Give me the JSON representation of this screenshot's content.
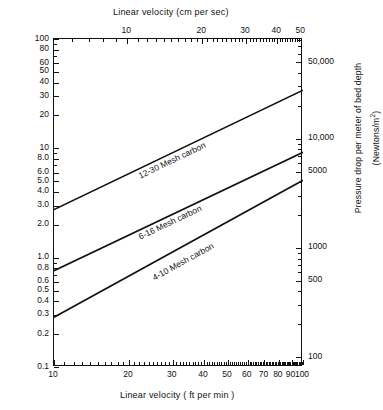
{
  "chart_data": {
    "type": "line",
    "title": "",
    "scale": {
      "x": "log",
      "y": "log"
    },
    "grid": false,
    "legend_position": "inline-curve-labels",
    "axes": {
      "bottom": {
        "label": "Linear  velocity ( ft  per min )",
        "ticks": [
          10,
          20,
          30,
          40,
          50,
          60,
          70,
          80,
          90,
          100
        ],
        "tick_labels": [
          "10",
          "20",
          "30",
          "40",
          "50",
          "60",
          "70",
          "80",
          "90",
          "100"
        ],
        "range": [
          10,
          100
        ]
      },
      "top": {
        "label": "Linear velocity (cm per sec)",
        "ticks": [
          10,
          20,
          30,
          40,
          50
        ],
        "tick_labels": [
          "10",
          "20",
          "30",
          "40",
          "50"
        ],
        "range": [
          5.08,
          50.8
        ]
      },
      "left": {
        "label": "Pressure drop per foot of bed depth (in. of water)",
        "ticks": [
          100,
          80,
          60,
          50,
          40,
          30,
          20,
          10,
          8.0,
          6.0,
          5.0,
          4.0,
          3.0,
          2.0,
          1.0,
          0.8,
          0.6,
          0.5,
          0.4,
          0.3,
          0.2,
          0.1
        ],
        "tick_labels": [
          "100",
          "80",
          "60",
          "50",
          "40",
          "30",
          "20",
          "10",
          "8.0",
          "6.0",
          "5.0",
          "4.0",
          "3.0",
          "2.0",
          "1.0",
          "0.8",
          "0.6",
          "0.5",
          "0.4",
          "0.3",
          "0.2",
          "0.1"
        ],
        "range": [
          0.1,
          100
        ]
      },
      "right": {
        "label": "Pressure drop per meter of bed depth (Newtons/m",
        "label_sup": "2",
        "label_tail": ")",
        "ticks": [
          50000,
          10000,
          5000,
          1000,
          500,
          100
        ],
        "tick_labels": [
          "50,000",
          "10,000",
          "5000",
          "1000",
          "500",
          "100"
        ],
        "range": [
          81.5,
          81500
        ]
      }
    },
    "series": [
      {
        "name": "12-30 Mesh carbon",
        "label": "12-30  Mesh carbon",
        "x": [
          10,
          100
        ],
        "y": [
          2.75,
          34.0
        ],
        "label_x": 22,
        "label_y": 6.2
      },
      {
        "name": "6-16 Mesh carbon",
        "label": "6-16  Mesh carbon",
        "x": [
          10,
          100
        ],
        "y": [
          0.76,
          9.2
        ],
        "label_x": 22,
        "label_y": 1.72
      },
      {
        "name": "4-10 Mesh carbon",
        "label": "4-10  Mesh carbon",
        "x": [
          10,
          100
        ],
        "y": [
          0.285,
          5.1
        ],
        "label_x": 25,
        "label_y": 0.72
      }
    ]
  }
}
